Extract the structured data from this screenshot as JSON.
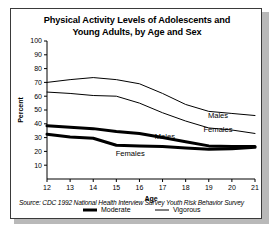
{
  "figure": {
    "title_line1": "Physical Activity Levels of Adolescents and",
    "title_line2": "Young Adults, by Age and Sex",
    "source": "Source: CDC 1992 National Health Interview Survey Youth Risk Behavior Survey",
    "border_color": "#3a3a3a",
    "line_color": "#000000",
    "background": "#ffffff"
  },
  "legend": {
    "position": "bottom-center",
    "entries": [
      {
        "label": "Moderate",
        "style": "thick"
      },
      {
        "label": "Vigorous",
        "style": "thin"
      }
    ]
  },
  "annotations": [
    {
      "text": "Males",
      "series": "males_vigorous",
      "x": 19.4,
      "y": 44
    },
    {
      "text": "Females",
      "series": "females_vigorous",
      "x": 19.4,
      "y": 34
    },
    {
      "text": "Males",
      "series": "males_moderate",
      "x": 17.1,
      "y": 29
    },
    {
      "text": "Females",
      "series": "females_moderate",
      "x": 15.6,
      "y": 17
    }
  ],
  "chart_data": {
    "type": "line",
    "title": "Physical Activity Levels of Adolescents and Young Adults, by Age and Sex",
    "xlabel": "Age",
    "ylabel": "Percent",
    "x": [
      12,
      13,
      14,
      15,
      16,
      17,
      18,
      19,
      20,
      21
    ],
    "xlim": [
      12,
      21
    ],
    "ylim": [
      0,
      100
    ],
    "yticks": [
      10,
      20,
      30,
      40,
      50,
      60,
      70,
      80,
      90,
      100
    ],
    "xticks": [
      12,
      13,
      14,
      15,
      16,
      17,
      18,
      19,
      20,
      21
    ],
    "grid": false,
    "series": [
      {
        "name": "Males Vigorous",
        "sex": "Males",
        "activity": "Vigorous",
        "style": "thin",
        "values": [
          70,
          72,
          73.5,
          72,
          69,
          62,
          54,
          49,
          47.5,
          46
        ]
      },
      {
        "name": "Females Vigorous",
        "sex": "Females",
        "activity": "Vigorous",
        "style": "thin",
        "values": [
          63,
          62,
          60.5,
          60,
          55,
          48,
          42,
          37,
          35.5,
          33
        ]
      },
      {
        "name": "Males Moderate",
        "sex": "Males",
        "activity": "Moderate",
        "style": "thick",
        "values": [
          38.5,
          37.5,
          36.5,
          34.5,
          33,
          30,
          27,
          24,
          23.5,
          23.5
        ]
      },
      {
        "name": "Females Moderate",
        "sex": "Females",
        "activity": "Moderate",
        "style": "thick",
        "values": [
          32.5,
          30.5,
          29.5,
          24.5,
          24,
          23.5,
          22.5,
          21.5,
          22,
          23
        ]
      }
    ]
  }
}
